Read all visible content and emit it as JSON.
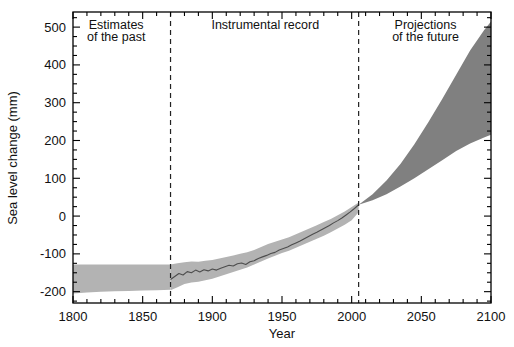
{
  "chart_data": {
    "type": "area",
    "title": "",
    "xlabel": "Year",
    "ylabel": "Sea level change (mm)",
    "xlim": [
      1800,
      2100
    ],
    "ylim": [
      -230,
      540
    ],
    "grid": false,
    "legend": "none",
    "xticks": [
      1800,
      1850,
      1900,
      1950,
      2000,
      2050,
      2100
    ],
    "xtick_labels": [
      "1800",
      "1850",
      "1900",
      "1950",
      "2000",
      "2050",
      "2100"
    ],
    "xminor_step": 10,
    "yticks": [
      -200,
      -100,
      0,
      100,
      200,
      300,
      400,
      500
    ],
    "ytick_labels": [
      "-200",
      "-100",
      "0",
      "100",
      "200",
      "300",
      "400",
      "500"
    ],
    "yminor_step": 25,
    "annotations": [
      {
        "name": "estimates-of-the-past",
        "line1": "Estimates",
        "line2": "of the past",
        "x": 1831
      },
      {
        "name": "instrumental-record",
        "line1": "Instrumental record",
        "line2": "",
        "x": 1938
      },
      {
        "name": "projections-of-the-future",
        "line1": "Projections",
        "line2": "of the future",
        "x": 2053
      }
    ],
    "dividers": [
      {
        "name": "divider-1870",
        "x": 1870,
        "style": "dashed"
      },
      {
        "name": "divider-2005",
        "x": 2005,
        "style": "dashed"
      }
    ],
    "colors": {
      "past_band": "#b3b3b3",
      "instrumental_band": "#b3b3b3",
      "instrumental_line": "#4d4d4d",
      "projection_band": "#808080",
      "axis": "#000000",
      "text": "#111111"
    },
    "series": [
      {
        "name": "Estimates of the past (uncertainty band)",
        "type": "band",
        "x": [
          1800,
          1810,
          1820,
          1830,
          1840,
          1850,
          1860,
          1870
        ],
        "upper": [
          -128,
          -128,
          -128,
          -128,
          -128,
          -128,
          -128,
          -128
        ],
        "lower": [
          -205,
          -202,
          -200,
          -199,
          -198,
          -197,
          -196,
          -195
        ]
      },
      {
        "name": "Instrumental record (uncertainty band)",
        "type": "band",
        "x": [
          1870,
          1875,
          1880,
          1885,
          1890,
          1895,
          1900,
          1905,
          1910,
          1915,
          1920,
          1925,
          1930,
          1935,
          1940,
          1945,
          1950,
          1955,
          1960,
          1965,
          1970,
          1975,
          1980,
          1985,
          1990,
          1995,
          2000,
          2005
        ],
        "upper": [
          -128,
          -125,
          -122,
          -120,
          -121,
          -118,
          -116,
          -112,
          -108,
          -104,
          -100,
          -96,
          -90,
          -82,
          -74,
          -68,
          -62,
          -56,
          -48,
          -40,
          -32,
          -24,
          -16,
          -8,
          2,
          12,
          24,
          36
        ],
        "lower": [
          -196,
          -188,
          -180,
          -176,
          -174,
          -170,
          -166,
          -160,
          -154,
          -148,
          -142,
          -136,
          -128,
          -120,
          -112,
          -105,
          -98,
          -92,
          -84,
          -76,
          -68,
          -60,
          -52,
          -43,
          -33,
          -23,
          -11,
          10
        ]
      },
      {
        "name": "Instrumental record (mean)",
        "type": "line",
        "x": [
          1870,
          1873,
          1876,
          1879,
          1882,
          1885,
          1888,
          1891,
          1894,
          1897,
          1900,
          1903,
          1906,
          1909,
          1912,
          1915,
          1918,
          1921,
          1924,
          1927,
          1930,
          1933,
          1936,
          1939,
          1942,
          1945,
          1948,
          1951,
          1954,
          1957,
          1960,
          1963,
          1966,
          1969,
          1972,
          1975,
          1978,
          1981,
          1984,
          1987,
          1990,
          1993,
          1996,
          1999,
          2002,
          2005
        ],
        "y": [
          -168,
          -160,
          -152,
          -156,
          -147,
          -150,
          -143,
          -148,
          -142,
          -145,
          -140,
          -143,
          -138,
          -134,
          -130,
          -132,
          -126,
          -124,
          -128,
          -121,
          -118,
          -112,
          -108,
          -104,
          -99,
          -96,
          -90,
          -86,
          -82,
          -76,
          -71,
          -66,
          -60,
          -54,
          -48,
          -43,
          -37,
          -31,
          -25,
          -18,
          -12,
          -5,
          3,
          11,
          20,
          30
        ]
      },
      {
        "name": "Projections of the future (range)",
        "type": "band",
        "x": [
          2005,
          2015,
          2025,
          2035,
          2045,
          2055,
          2065,
          2075,
          2085,
          2095,
          2100
        ],
        "upper": [
          30,
          58,
          94,
          138,
          190,
          248,
          310,
          374,
          438,
          492,
          515
        ],
        "lower": [
          30,
          42,
          58,
          78,
          100,
          124,
          148,
          172,
          192,
          208,
          215
        ]
      }
    ]
  },
  "axes": {
    "x_title": "Year",
    "y_title": "Sea level change (mm)"
  }
}
